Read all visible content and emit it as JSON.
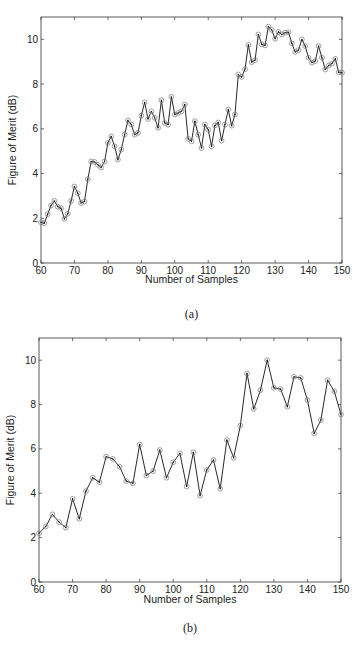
{
  "chart_data": [
    {
      "type": "line",
      "caption": "(a)",
      "title": "",
      "xlabel": "Number of Samples",
      "ylabel": "Figure of Merit (dB)",
      "xlim": [
        60,
        150
      ],
      "ylim": [
        0,
        11
      ],
      "xticks": [
        60,
        70,
        80,
        90,
        100,
        110,
        120,
        130,
        140,
        150
      ],
      "yticks": [
        0,
        2,
        4,
        6,
        8,
        10
      ],
      "grid": false,
      "marker": "circle",
      "series": [
        {
          "name": "Figure of Merit",
          "x": [
            60,
            61,
            62,
            63,
            64,
            65,
            66,
            67,
            68,
            69,
            70,
            71,
            72,
            73,
            74,
            75,
            76,
            77,
            78,
            79,
            80,
            81,
            82,
            83,
            84,
            85,
            86,
            87,
            88,
            89,
            90,
            91,
            92,
            93,
            94,
            95,
            96,
            97,
            98,
            99,
            100,
            101,
            102,
            103,
            104,
            105,
            106,
            107,
            108,
            109,
            110,
            111,
            112,
            113,
            114,
            115,
            116,
            117,
            118,
            119,
            120,
            121,
            122,
            123,
            124,
            125,
            126,
            127,
            128,
            129,
            130,
            131,
            132,
            133,
            134,
            135,
            136,
            137,
            138,
            139,
            140,
            141,
            142,
            143,
            144,
            145,
            146,
            147,
            148,
            149,
            150
          ],
          "values": [
            1.82,
            1.78,
            2.18,
            2.57,
            2.78,
            2.52,
            2.45,
            1.97,
            2.2,
            2.78,
            3.42,
            3.12,
            2.68,
            2.75,
            3.75,
            4.54,
            4.52,
            4.39,
            4.27,
            4.54,
            5.37,
            5.66,
            5.22,
            4.62,
            5.07,
            5.74,
            6.37,
            6.19,
            5.74,
            5.82,
            6.59,
            7.18,
            6.44,
            6.78,
            6.49,
            6.04,
            7.28,
            6.26,
            6.19,
            7.43,
            6.64,
            6.71,
            6.78,
            7.09,
            5.55,
            5.44,
            6.34,
            5.74,
            5.14,
            6.19,
            5.96,
            5.22,
            6.15,
            6.28,
            5.47,
            6.19,
            6.86,
            6.14,
            6.64,
            8.43,
            8.32,
            8.67,
            9.75,
            8.98,
            9.07,
            10.22,
            9.78,
            9.73,
            10.57,
            10.42,
            10.03,
            10.33,
            10.22,
            10.3,
            10.32,
            9.82,
            9.44,
            9.52,
            10.0,
            9.7,
            9.18,
            8.96,
            9.03,
            9.7,
            9.18,
            8.65,
            8.83,
            8.92,
            9.13,
            8.53,
            8.51
          ]
        }
      ]
    },
    {
      "type": "line",
      "caption": "(b)",
      "title": "",
      "xlabel": "Number of Samples",
      "ylabel": "Figure of Merit (dB)",
      "xlim": [
        60,
        150
      ],
      "ylim": [
        0,
        11
      ],
      "xticks": [
        60,
        70,
        80,
        90,
        100,
        110,
        120,
        130,
        140,
        150
      ],
      "yticks": [
        0,
        2,
        4,
        6,
        8,
        10
      ],
      "grid": false,
      "marker": "circle",
      "series": [
        {
          "name": "Figure of Merit",
          "x": [
            60,
            62,
            64,
            66,
            68,
            70,
            72,
            74,
            76,
            78,
            80,
            82,
            84,
            86,
            88,
            90,
            92,
            94,
            96,
            98,
            100,
            102,
            104,
            106,
            108,
            110,
            112,
            114,
            116,
            118,
            120,
            122,
            124,
            126,
            128,
            130,
            132,
            134,
            136,
            138,
            140,
            142,
            144,
            146,
            148,
            150
          ],
          "values": [
            2.2,
            2.5,
            3.05,
            2.7,
            2.45,
            3.75,
            2.85,
            4.1,
            4.7,
            4.5,
            5.65,
            5.55,
            5.2,
            4.55,
            4.45,
            6.2,
            4.8,
            5.0,
            5.95,
            4.7,
            5.4,
            5.8,
            4.3,
            5.85,
            3.9,
            5.05,
            5.5,
            4.2,
            6.4,
            5.6,
            7.05,
            9.4,
            7.8,
            8.65,
            10.0,
            8.75,
            8.7,
            7.9,
            9.25,
            9.2,
            8.2,
            6.7,
            7.3,
            9.1,
            8.6,
            7.55
          ]
        }
      ]
    }
  ]
}
